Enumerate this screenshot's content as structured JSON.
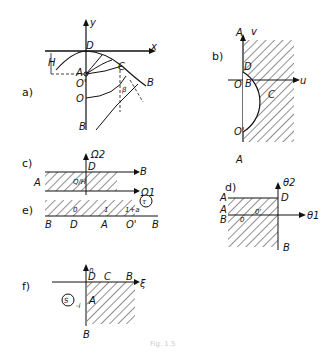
{
  "figure": {
    "caption": "Fig. 1.5",
    "panels": {
      "a": {
        "label": "a)",
        "axis_x": "x",
        "axis_y": "y",
        "points": [
          "D",
          "H",
          "A",
          "O'",
          "O",
          "B",
          "C",
          "B",
          "β"
        ]
      },
      "b": {
        "label": "b)",
        "axis_x": "u",
        "axis_y": "v",
        "points": [
          "A",
          "D",
          "O",
          "B",
          "C",
          "O'",
          "A"
        ]
      },
      "c": {
        "label": "c)",
        "axis_x": "Ω1",
        "axis_y": "Ω2",
        "points": [
          "A",
          "D",
          "B"
        ],
        "height_label": "Q/H"
      },
      "d": {
        "label": "d)",
        "axis_x": "θ1",
        "axis_y": "θ2",
        "points": [
          "A",
          "D",
          "A",
          "B",
          "0",
          "0'",
          "B"
        ]
      },
      "e": {
        "label": "e)",
        "circle_label": "τ",
        "points": [
          "B",
          "D",
          "A",
          "O'",
          "B"
        ],
        "values": [
          "0",
          "1",
          "1+a"
        ]
      },
      "f": {
        "label": "f)",
        "axis_x": "ξ",
        "axis_y": "η",
        "circle_label": "S",
        "points": [
          "D",
          "C",
          "B",
          "A",
          "B"
        ],
        "value": "-i"
      }
    }
  }
}
